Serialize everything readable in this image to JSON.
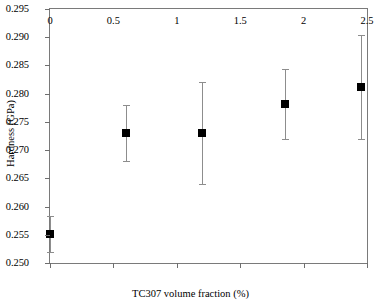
{
  "chart_data": {
    "type": "scatter",
    "title": "",
    "xlabel": "TC307 volume fraction (%)",
    "ylabel": "Hardness (GPa)",
    "xlim": [
      0,
      2.5
    ],
    "ylim": [
      0.25,
      0.295
    ],
    "grid": false,
    "legend": null,
    "xticks": [
      0,
      0.5,
      1,
      1.5,
      2,
      2.5
    ],
    "xtick_labels": [
      "0",
      "0.5",
      "1",
      "1.5",
      "2",
      "2.5"
    ],
    "yticks": [
      0.25,
      0.255,
      0.26,
      0.265,
      0.27,
      0.275,
      0.28,
      0.285,
      0.29,
      0.295
    ],
    "ytick_labels": [
      "0.250",
      "0.255",
      "0.260",
      "0.265",
      "0.270",
      "0.275",
      "0.280",
      "0.285",
      "0.290",
      "0.295"
    ],
    "marker_style": "filled-square",
    "marker_color": "#000000",
    "errorbar_color": "#8d8d8d",
    "frame_color": "#7a7a7a",
    "points": [
      {
        "x": 0.0,
        "y": 0.2552,
        "yerr_low": 0.0032,
        "yerr_high": 0.0032
      },
      {
        "x": 0.6,
        "y": 0.273,
        "yerr_low": 0.005,
        "yerr_high": 0.005
      },
      {
        "x": 1.2,
        "y": 0.273,
        "yerr_low": 0.009,
        "yerr_high": 0.009
      },
      {
        "x": 1.85,
        "y": 0.2782,
        "yerr_low": 0.0062,
        "yerr_high": 0.0062
      },
      {
        "x": 2.45,
        "y": 0.2812,
        "yerr_low": 0.0092,
        "yerr_high": 0.0092
      }
    ]
  }
}
